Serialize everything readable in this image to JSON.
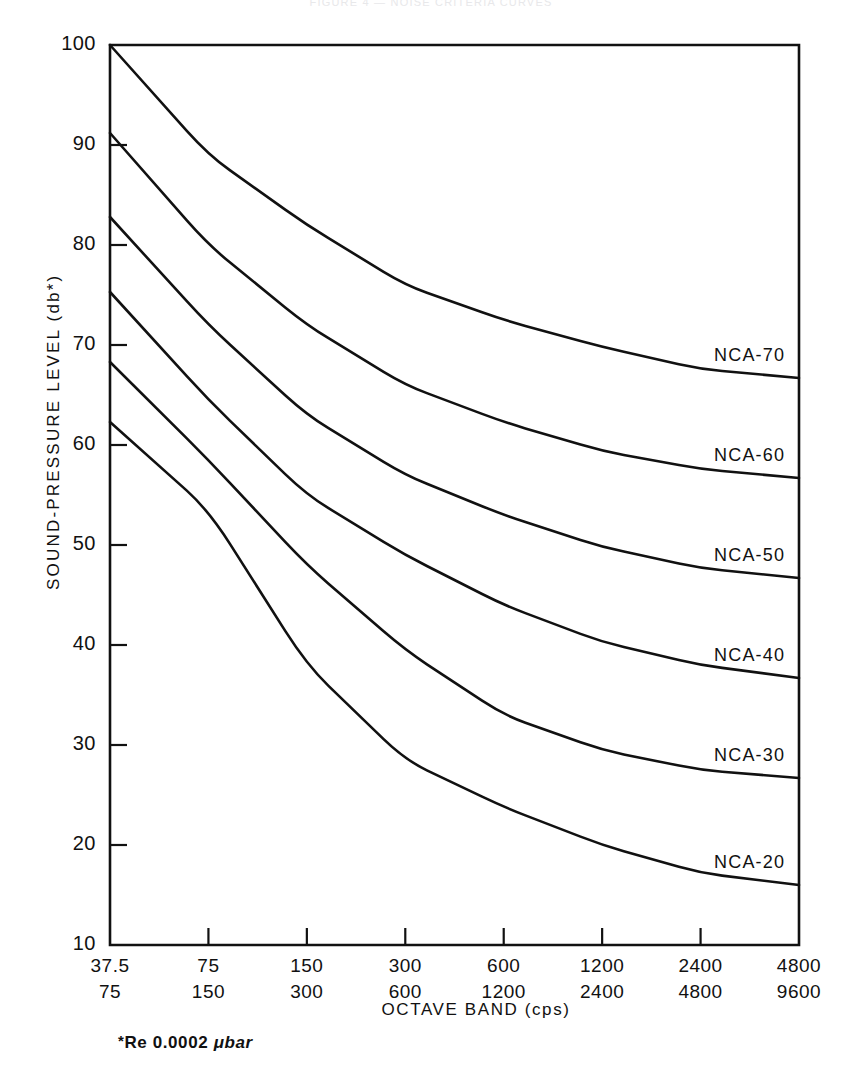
{
  "figure": {
    "title": "FIGURE 4 — NOISE CRITERIA CURVES",
    "ylabel": "SOUND-PRESSURE LEVEL (db*)",
    "xlabel": "OCTAVE BAND (cps)",
    "footnote_marker": "*",
    "footnote_text": "Re  0.0002 ",
    "footnote_unit": "μbar"
  },
  "chart_data": {
    "type": "line",
    "title": "FIGURE 4 — NOISE CRITERIA CURVES",
    "xlabel": "OCTAVE BAND (cps)",
    "ylabel": "SOUND-PRESSURE LEVEL (db*)",
    "ylim": [
      10,
      100
    ],
    "ytick_labels": [
      "100",
      "90",
      "80",
      "70",
      "60",
      "50",
      "40",
      "30",
      "20",
      "10"
    ],
    "ytick_values": [
      100,
      90,
      80,
      70,
      60,
      50,
      40,
      30,
      20,
      10
    ],
    "grid": false,
    "legend_position": "inline-right-of-curve",
    "x_axis_style": "octave-band-bins",
    "x_bin_lower": [
      "37.5",
      "75",
      "150",
      "300",
      "600",
      "1200",
      "2400",
      "4800"
    ],
    "x_bin_upper": [
      "75",
      "150",
      "300",
      "600",
      "1200",
      "2400",
      "4800",
      "9600"
    ],
    "x_positions": [
      0,
      1,
      2,
      3,
      4,
      5,
      6,
      7
    ],
    "series": [
      {
        "name": "NCA-70",
        "label": "NCA-70",
        "values": [
          100.0,
          89.0,
          82.0,
          76.0,
          72.5,
          69.8,
          67.6,
          66.7
        ]
      },
      {
        "name": "NCA-60",
        "label": "NCA-60",
        "values": [
          91.2,
          80.0,
          72.0,
          66.0,
          62.3,
          59.4,
          57.6,
          56.7
        ]
      },
      {
        "name": "NCA-50",
        "label": "NCA-50",
        "values": [
          82.8,
          72.0,
          63.0,
          57.0,
          53.0,
          49.8,
          47.7,
          46.7
        ]
      },
      {
        "name": "NCA-40",
        "label": "NCA-40",
        "values": [
          75.3,
          64.5,
          55.0,
          49.0,
          44.0,
          40.3,
          38.0,
          36.7
        ]
      },
      {
        "name": "NCA-30",
        "label": "NCA-30",
        "values": [
          68.3,
          58.5,
          48.0,
          39.5,
          33.0,
          29.5,
          27.5,
          26.7
        ]
      },
      {
        "name": "NCA-20",
        "label": "NCA-20",
        "values": [
          62.3,
          53.5,
          38.0,
          28.5,
          23.8,
          20.0,
          17.2,
          16.0
        ]
      }
    ],
    "curve_label_x": [
      0,
      0,
      0,
      0,
      0,
      0
    ]
  },
  "colors": {
    "axis": "#111111",
    "curve": "#111111",
    "background": "#ffffff"
  }
}
